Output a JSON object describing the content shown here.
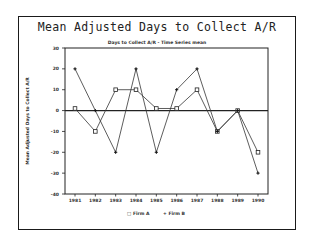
{
  "chart_data": {
    "type": "line",
    "title": "Mean Adjusted Days to Collect A/R",
    "subtitle": "Days to Collect A/R - Time Series mean",
    "xlabel": "",
    "ylabel": "Mean Adjusted Days to Collect A/R",
    "categories": [
      "1981",
      "1982",
      "1983",
      "1984",
      "1985",
      "1986",
      "1987",
      "1988",
      "1989",
      "1990"
    ],
    "ylim": [
      -40,
      30
    ],
    "yticks": [
      30,
      20,
      10,
      0,
      -10,
      -20,
      -30,
      -40
    ],
    "series": [
      {
        "name": "Firm A",
        "marker": "square",
        "values": [
          1,
          -10,
          10,
          10,
          1,
          1,
          10,
          -10,
          0,
          -20
        ]
      },
      {
        "name": "Firm B",
        "marker": "plus",
        "values": [
          20,
          0,
          -20,
          20,
          -20,
          10,
          20,
          -10,
          0,
          -30
        ]
      }
    ],
    "zero_line": true,
    "grid": false,
    "legend_position": "bottom"
  },
  "legend": {
    "firm_a": "□ Firm A",
    "firm_b": "+ Firm B"
  }
}
